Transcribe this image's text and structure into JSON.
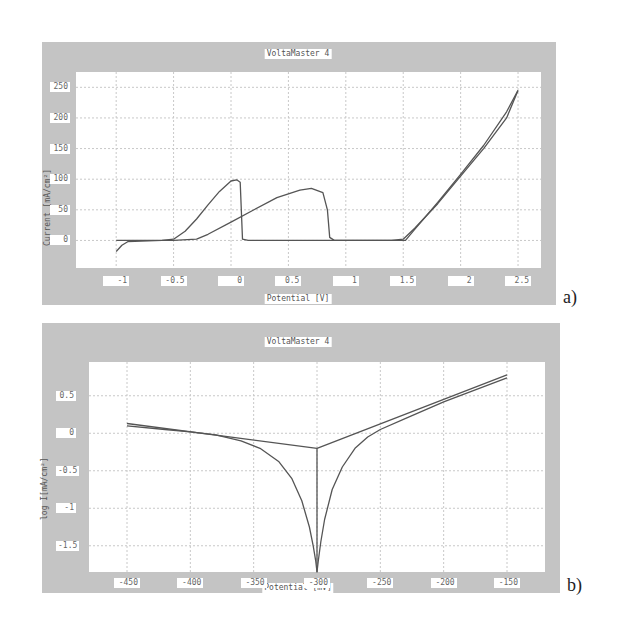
{
  "chart_data": [
    {
      "id": "a",
      "type": "line",
      "title": "VoltaMaster 4",
      "xlabel": "Potential [V]",
      "ylabel": "Current [mA/cm²]",
      "caption": "a)",
      "xlim": [
        -1.35,
        2.7
      ],
      "ylim": [
        -45,
        275
      ],
      "grid": true,
      "x_ticks": [
        -1,
        -0.5,
        0,
        0.5,
        1,
        1.5,
        2,
        2.5
      ],
      "x_tick_labels": [
        "-1",
        "-0.5",
        "0",
        "0.5",
        "1",
        "1.5",
        "2",
        "2.5"
      ],
      "y_ticks": [
        0,
        50,
        100,
        150,
        200,
        250
      ],
      "y_tick_labels": [
        "0",
        "50",
        "100",
        "150",
        "200",
        "250"
      ],
      "series": [
        {
          "name": "forward sweep",
          "x": [
            -1.0,
            -0.95,
            -0.9,
            -0.6,
            -0.5,
            -0.4,
            -0.3,
            -0.2,
            -0.1,
            0.0,
            0.05,
            0.08,
            0.1,
            0.15,
            0.5,
            1.0,
            1.4,
            1.5,
            1.6,
            1.8,
            2.0,
            2.2,
            2.4,
            2.5
          ],
          "y": [
            -18,
            -8,
            -2,
            0,
            2,
            15,
            35,
            58,
            80,
            97,
            99,
            95,
            2,
            0,
            0,
            0,
            0,
            2,
            20,
            60,
            105,
            150,
            200,
            245
          ]
        },
        {
          "name": "reverse sweep",
          "x": [
            2.5,
            2.4,
            2.2,
            2.0,
            1.8,
            1.6,
            1.52,
            1.4,
            1.0,
            0.9,
            0.86,
            0.84,
            0.8,
            0.7,
            0.6,
            0.4,
            0.2,
            0.0,
            -0.2,
            -0.3,
            -0.5,
            -1.0
          ],
          "y": [
            245,
            210,
            155,
            108,
            62,
            18,
            0,
            0,
            0,
            0,
            5,
            50,
            78,
            85,
            82,
            70,
            50,
            30,
            10,
            2,
            0,
            0
          ]
        }
      ]
    },
    {
      "id": "b",
      "type": "line",
      "title": "VoltaMaster 4",
      "xlabel": "Potential [mV]",
      "ylabel": "log I[mA/cm²]",
      "caption": "b)",
      "xlim": [
        -480,
        -120
      ],
      "ylim": [
        -1.85,
        0.95
      ],
      "grid": true,
      "x_ticks": [
        -450,
        -400,
        -350,
        -300,
        -250,
        -200,
        -150
      ],
      "x_tick_labels": [
        "-450",
        "-400",
        "-350",
        "-300",
        "-250",
        "-200",
        "-150"
      ],
      "y_ticks": [
        0.5,
        0,
        -0.5,
        -1,
        -1.5
      ],
      "y_tick_labels": [
        "0.5",
        "0",
        "-0.5",
        "-1",
        "-1.5"
      ],
      "series": [
        {
          "name": "measured polarization curve",
          "x": [
            -450,
            -420,
            -400,
            -380,
            -360,
            -345,
            -330,
            -320,
            -312,
            -306,
            -303,
            -301,
            -300,
            -299,
            -297,
            -294,
            -288,
            -280,
            -270,
            -260,
            -250,
            -230,
            -200,
            -175,
            -150
          ],
          "y": [
            0.1,
            0.05,
            0.02,
            -0.02,
            -0.1,
            -0.2,
            -0.38,
            -0.6,
            -0.9,
            -1.25,
            -1.5,
            -1.7,
            -1.85,
            -1.7,
            -1.45,
            -1.15,
            -0.75,
            -0.45,
            -0.2,
            -0.05,
            0.05,
            0.2,
            0.42,
            0.58,
            0.74
          ]
        },
        {
          "name": "Tafel fit",
          "x": [
            -450,
            -300,
            -150
          ],
          "y": [
            0.13,
            -0.2,
            0.78
          ]
        },
        {
          "name": "corrosion potential marker",
          "x": [
            -300,
            -300
          ],
          "y": [
            -0.2,
            -1.85
          ]
        }
      ]
    }
  ]
}
